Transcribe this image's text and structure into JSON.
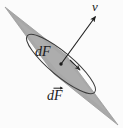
{
  "figure": {
    "kind": "physics-vector-diagram",
    "background_color": "#fbfbfb",
    "surface_fill_color": "#a8a8a8",
    "surface_edge_color": "#8f8f8f",
    "outline_color": "#3a3a3a",
    "ink_color": "#1c1c1c",
    "labels": {
      "normal_vector": "ν",
      "area_element": "dF",
      "area_element_vector": "dF"
    },
    "annotations": {
      "normal_vector_name": "nu",
      "normal_vector_description": "unit normal vector arrow",
      "point_description": "base point of the normal vector on the surface element",
      "ellipse_description": "oriented boundary curve of the surface element",
      "surface_description": "shaded planar surface element"
    },
    "geometry": {
      "surface_polygon": "5,7 66,55 118,125 54,74",
      "ellipse_center_x": 61,
      "ellipse_center_y": 64,
      "ellipse_rx": 44,
      "ellipse_ry": 11.5,
      "ellipse_rotation_deg": 40,
      "normal_arrow_start_x": 61,
      "normal_arrow_start_y": 64,
      "normal_arrow_end_x": 96,
      "normal_arrow_end_y": 16,
      "point_x": 61,
      "point_y": 64,
      "circulation_arrow_x": 76,
      "circulation_arrow_y": 67
    }
  }
}
